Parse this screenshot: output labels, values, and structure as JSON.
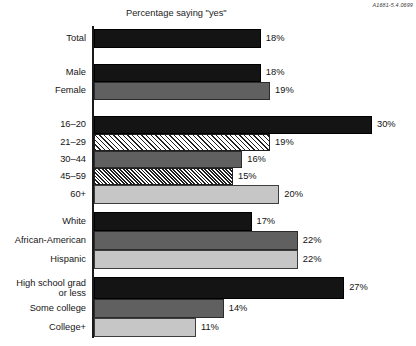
{
  "doc_id": "A1681-5.4.0699",
  "chart_data": {
    "type": "bar",
    "orientation": "horizontal",
    "title": "Percentage saying \"yes\"",
    "xlabel": "",
    "ylabel": "",
    "xlim": [
      0,
      30
    ],
    "grid": false,
    "legend": null,
    "value_suffix": "%",
    "categories": [
      "Total",
      "Male",
      "Female",
      "16–20",
      "21–29",
      "30–44",
      "45–59",
      "60+",
      "White",
      "African-American",
      "Hispanic",
      "High school grad or less",
      "Some college",
      "College+"
    ],
    "values": [
      18,
      18,
      19,
      30,
      19,
      16,
      15,
      20,
      17,
      22,
      22,
      27,
      14,
      11
    ],
    "value_labels": [
      "18%",
      "18%",
      "19%",
      "30%",
      "19%",
      "16%",
      "15%",
      "20%",
      "17%",
      "22%",
      "22%",
      "27%",
      "14%",
      "11%"
    ],
    "groups": [
      {
        "name": "overall",
        "categories": [
          "Total"
        ]
      },
      {
        "name": "gender",
        "categories": [
          "Male",
          "Female"
        ]
      },
      {
        "name": "age",
        "categories": [
          "16–20",
          "21–29",
          "30–44",
          "45–59",
          "60+"
        ]
      },
      {
        "name": "race",
        "categories": [
          "White",
          "African-American",
          "Hispanic"
        ]
      },
      {
        "name": "education",
        "categories": [
          "High school grad or less",
          "Some college",
          "College+"
        ]
      }
    ],
    "bars": [
      {
        "label": "Total",
        "label_line1": "Total",
        "label_line2": "",
        "value": 18,
        "value_label": "18%",
        "fill": "black",
        "color": "#141414",
        "y": 29,
        "h": 19
      },
      {
        "label": "Male",
        "label_line1": "Male",
        "label_line2": "",
        "value": 18,
        "value_label": "18%",
        "fill": "black",
        "color": "#141414",
        "y": 64,
        "h": 18
      },
      {
        "label": "Female",
        "label_line1": "Female",
        "label_line2": "",
        "value": 19,
        "value_label": "19%",
        "fill": "darkgray",
        "color": "#606060",
        "y": 82,
        "h": 18
      },
      {
        "label": "16–20",
        "label_line1": "16–20",
        "label_line2": "",
        "value": 30,
        "value_label": "30%",
        "fill": "black",
        "color": "#141414",
        "y": 116,
        "h": 18
      },
      {
        "label": "21–29",
        "label_line1": "21–29",
        "label_line2": "",
        "value": 19,
        "value_label": "19%",
        "fill": "hatch-light",
        "color": "#1f1f1f",
        "y": 134,
        "h": 17
      },
      {
        "label": "30–44",
        "label_line1": "30–44",
        "label_line2": "",
        "value": 16,
        "value_label": "16%",
        "fill": "darkgray",
        "color": "#606060",
        "y": 151,
        "h": 17
      },
      {
        "label": "45–59",
        "label_line1": "45–59",
        "label_line2": "",
        "value": 15,
        "value_label": "15%",
        "fill": "hatch-dense",
        "color": "#1f1f1f",
        "y": 168,
        "h": 17
      },
      {
        "label": "60+",
        "label_line1": "60+",
        "label_line2": "",
        "value": 20,
        "value_label": "20%",
        "fill": "lightgray",
        "color": "#c6c6c6",
        "y": 185,
        "h": 19
      },
      {
        "label": "White",
        "label_line1": "White",
        "label_line2": "",
        "value": 17,
        "value_label": "17%",
        "fill": "black",
        "color": "#141414",
        "y": 212,
        "h": 19
      },
      {
        "label": "African-American",
        "label_line1": "African-American",
        "label_line2": "",
        "value": 22,
        "value_label": "22%",
        "fill": "darkgray",
        "color": "#606060",
        "y": 231,
        "h": 19
      },
      {
        "label": "Hispanic",
        "label_line1": "Hispanic",
        "label_line2": "",
        "value": 22,
        "value_label": "22%",
        "fill": "lightgray",
        "color": "#c6c6c6",
        "y": 250,
        "h": 19
      },
      {
        "label": "High school grad or less",
        "label_line1": "High school grad",
        "label_line2": "or less",
        "value": 27,
        "value_label": "27%",
        "fill": "black",
        "color": "#141414",
        "y": 277,
        "h": 22
      },
      {
        "label": "Some college",
        "label_line1": "Some college",
        "label_line2": "",
        "value": 14,
        "value_label": "14%",
        "fill": "darkgray",
        "color": "#606060",
        "y": 299,
        "h": 19
      },
      {
        "label": "College+",
        "label_line1": "College+",
        "label_line2": "",
        "value": 11,
        "value_label": "11%",
        "fill": "lightgray",
        "color": "#c6c6c6",
        "y": 318,
        "h": 19
      }
    ]
  }
}
